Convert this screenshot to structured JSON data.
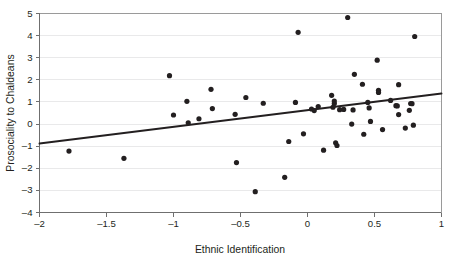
{
  "chart_data": {
    "type": "scatter",
    "title": "",
    "xlabel": "Ethnic Identification",
    "ylabel": "Prosociality to Chaldeans",
    "xlim": [
      -2,
      1
    ],
    "ylim": [
      -4,
      5
    ],
    "xticks": [
      -2,
      -1.5,
      -1,
      -0.5,
      0,
      0.5,
      1
    ],
    "xtick_labels": [
      "–2",
      "–1.5",
      "–1",
      "–0.5",
      "0",
      "0.5",
      "1"
    ],
    "yticks": [
      -4,
      -3,
      -2,
      -1,
      0,
      1,
      2,
      3,
      4,
      5
    ],
    "ytick_labels": [
      "–4",
      "–3",
      "–2",
      "–1",
      "0",
      "1",
      "2",
      "3",
      "4",
      "5"
    ],
    "grid": "horizontal",
    "legend": "none",
    "marker_color": "#231f20",
    "marker_size": 2.6,
    "gridline_color": "#e9e9ea",
    "axis_color": "#6f6f6f",
    "points": [
      {
        "x": -1.78,
        "y": -1.22
      },
      {
        "x": -1.37,
        "y": -1.55
      },
      {
        "x": -1.03,
        "y": 2.19
      },
      {
        "x": -1.0,
        "y": 0.41
      },
      {
        "x": -0.9,
        "y": 1.03
      },
      {
        "x": -0.89,
        "y": 0.06
      },
      {
        "x": -0.81,
        "y": 0.24
      },
      {
        "x": -0.72,
        "y": 1.57
      },
      {
        "x": -0.71,
        "y": 0.7
      },
      {
        "x": -0.54,
        "y": 0.44
      },
      {
        "x": -0.53,
        "y": -1.74
      },
      {
        "x": -0.46,
        "y": 1.2
      },
      {
        "x": -0.39,
        "y": -3.06
      },
      {
        "x": -0.33,
        "y": 0.94
      },
      {
        "x": -0.17,
        "y": -2.41
      },
      {
        "x": -0.14,
        "y": -0.79
      },
      {
        "x": -0.09,
        "y": 0.98
      },
      {
        "x": -0.07,
        "y": 4.15
      },
      {
        "x": -0.03,
        "y": -0.44
      },
      {
        "x": 0.03,
        "y": 0.68
      },
      {
        "x": 0.05,
        "y": 0.61
      },
      {
        "x": 0.08,
        "y": 0.79
      },
      {
        "x": 0.12,
        "y": -1.18
      },
      {
        "x": 0.18,
        "y": 1.3
      },
      {
        "x": 0.19,
        "y": 0.76
      },
      {
        "x": 0.2,
        "y": 1.04
      },
      {
        "x": 0.2,
        "y": 0.93
      },
      {
        "x": 0.21,
        "y": -0.85
      },
      {
        "x": 0.22,
        "y": -0.97
      },
      {
        "x": 0.24,
        "y": 0.65
      },
      {
        "x": 0.27,
        "y": 0.66
      },
      {
        "x": 0.3,
        "y": 4.82
      },
      {
        "x": 0.33,
        "y": 0.0
      },
      {
        "x": 0.35,
        "y": 2.25
      },
      {
        "x": 0.34,
        "y": 0.64
      },
      {
        "x": 0.41,
        "y": 1.8
      },
      {
        "x": 0.42,
        "y": -0.46
      },
      {
        "x": 0.45,
        "y": 0.98
      },
      {
        "x": 0.46,
        "y": 0.73
      },
      {
        "x": 0.47,
        "y": 0.12
      },
      {
        "x": 0.52,
        "y": 2.89
      },
      {
        "x": 0.53,
        "y": 1.53
      },
      {
        "x": 0.53,
        "y": 1.43
      },
      {
        "x": 0.56,
        "y": -0.25
      },
      {
        "x": 0.62,
        "y": 1.07
      },
      {
        "x": 0.66,
        "y": 0.83
      },
      {
        "x": 0.67,
        "y": 0.82
      },
      {
        "x": 0.68,
        "y": 1.78
      },
      {
        "x": 0.68,
        "y": 0.43
      },
      {
        "x": 0.73,
        "y": -0.18
      },
      {
        "x": 0.76,
        "y": 0.62
      },
      {
        "x": 0.77,
        "y": 0.93
      },
      {
        "x": 0.78,
        "y": 0.92
      },
      {
        "x": 0.79,
        "y": -0.05
      },
      {
        "x": 0.8,
        "y": 3.96
      }
    ],
    "fit_line": {
      "x_start": -2,
      "y_start": -0.88,
      "x_end": 1,
      "y_end": 1.38,
      "slope": 0.753,
      "intercept": 0.626,
      "color": "#231f20"
    }
  }
}
